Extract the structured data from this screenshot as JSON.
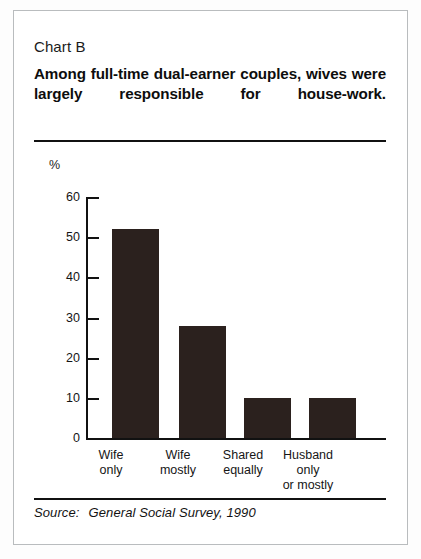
{
  "card": {
    "chart_label": "Chart B",
    "headline": "Among full-time dual-earner couples, wives were largely responsible for house-work.",
    "source_prefix": "Source:",
    "source_text": "General Social Survey, 1990"
  },
  "chart_data": {
    "type": "bar",
    "chart_id": "Chart B",
    "categories": [
      "Wife only",
      "Wife mostly",
      "Shared equally",
      "Husband only or mostly"
    ],
    "category_lines": [
      [
        "Wife",
        "only"
      ],
      [
        "Wife",
        "mostly"
      ],
      [
        "Shared",
        "equally"
      ],
      [
        "Husband",
        "only",
        "or mostly"
      ]
    ],
    "values": [
      52,
      28,
      10,
      10
    ],
    "xlabel": "",
    "ylabel": "%",
    "ylim": [
      0,
      60
    ],
    "yticks": [
      60,
      50,
      40,
      30,
      20,
      10,
      0
    ],
    "ytick_labels": [
      "60",
      "50",
      "40",
      "30",
      "20",
      "10",
      "0"
    ],
    "grid": false,
    "legend": false,
    "bar_color": "#2b211e",
    "axis_color": "#111111",
    "source": "Source: General Social Survey, 1990"
  }
}
